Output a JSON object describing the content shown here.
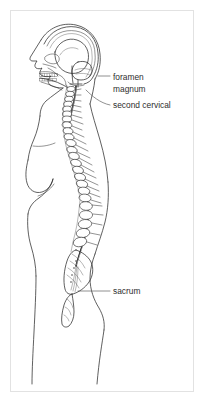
{
  "figure": {
    "view": "sagittal-lateral",
    "background_color": "#ffffff",
    "frame_color": "#e2e2e2",
    "ink_color": "#2b2b2b",
    "label_color": "#2e2e2e",
    "leader_color": "#555555"
  },
  "labels": [
    {
      "id": "foramen-magnum",
      "line1": "foramen",
      "line2": "magnum",
      "text_x": 113,
      "text_y": 80,
      "leader": "M 110 76 L 98 76",
      "target": "skull-base-opening"
    },
    {
      "id": "second-cervical",
      "line1": "second cervical",
      "line2": "",
      "text_x": 113,
      "text_y": 108,
      "leader": "M 110 105 C 100 103 92 96 86 90",
      "target": "axis-vertebra-C2"
    },
    {
      "id": "sacrum",
      "line1": "sacrum",
      "line2": "",
      "text_x": 113,
      "text_y": 294,
      "leader": "M 110 291 L 78 291",
      "target": "sacral-bone"
    }
  ],
  "anatomy": {
    "regions": [
      "skull",
      "brain",
      "cerebellum",
      "mandible",
      "teeth",
      "cervical-vertebrae",
      "thoracic-vertebrae",
      "lumbar-vertebrae",
      "sacrum",
      "coccyx",
      "spinal-cord",
      "body-outline"
    ],
    "vertebra_counts": {
      "cervical": 7,
      "thoracic": 12,
      "lumbar": 5
    }
  }
}
